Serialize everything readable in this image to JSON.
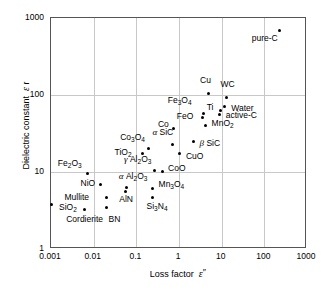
{
  "chart_data": {
    "type": "scatter",
    "title": "",
    "xlabel": "Loss factor ε ″",
    "ylabel": "Dielectric constant ε r",
    "xscale": "log",
    "yscale": "log",
    "xlim": [
      0.001,
      1000
    ],
    "ylim": [
      1,
      1000
    ],
    "xticks": [
      "0.001",
      "0.01",
      "0.1",
      "1",
      "10",
      "100",
      "1000"
    ],
    "yticks": [
      "1",
      "10",
      "100",
      "1000"
    ],
    "grid": true,
    "legend": "none",
    "points": [
      {
        "label": "SiO2",
        "label_html": "SiO<sub>2</sub>",
        "x": 0.001,
        "y": 3.8,
        "lx": 8,
        "ly": 4
      },
      {
        "label": "Cordierite",
        "label_html": "Cordierite",
        "x": 0.006,
        "y": 3.3,
        "lx": -18,
        "ly": 11
      },
      {
        "label": "Mullite",
        "label_html": "Mullite",
        "x": 0.02,
        "y": 4.7,
        "lx": -42,
        "ly": 1
      },
      {
        "label": "BN",
        "label_html": "BN",
        "x": 0.02,
        "y": 3.5,
        "lx": 2,
        "ly": 13
      },
      {
        "label": "Fe2O3",
        "label_html": "Fe<sub>2</sub>O<sub>3</sub>",
        "x": 0.0073,
        "y": 9.5,
        "lx": -30,
        "ly": -10
      },
      {
        "label": "NiO",
        "label_html": "NiO",
        "x": 0.0145,
        "y": 6.8,
        "lx": -20,
        "ly": -1
      },
      {
        "label": "AlN",
        "label_html": "AlN",
        "x": 0.055,
        "y": 5.6,
        "lx": -6,
        "ly": 9
      },
      {
        "label": "alpha-Al2O3",
        "label_html": "<span class='gk'>α</span> Al<sub>2</sub>O<sub>3</sub>",
        "x": 0.06,
        "y": 6.2,
        "lx": -8,
        "ly": -11
      },
      {
        "label": "Si3N4",
        "label_html": "Si<sub>3</sub>N<sub>4</sub>",
        "x": 0.24,
        "y": 4.6,
        "lx": -6,
        "ly": 9
      },
      {
        "label": "Mn3O4",
        "label_html": "Mn<sub>3</sub>O<sub>4</sub>",
        "x": 0.24,
        "y": 6.1,
        "lx": 6,
        "ly": -4
      },
      {
        "label": "TiO2",
        "label_html": "TiO<sub>2</sub>",
        "x": 0.14,
        "y": 17.5,
        "lx": -28,
        "ly": 0
      },
      {
        "label": "Co3O4",
        "label_html": "Co<sub>3</sub>O<sub>4</sub>",
        "x": 0.19,
        "y": 20.0,
        "lx": -28,
        "ly": -11
      },
      {
        "label": "gamma-Al2O3",
        "label_html": "<span class='gk'>γ</span> Al<sub>2</sub>O<sub>3</sub>",
        "x": 0.26,
        "y": 10.5,
        "lx": -30,
        "ly": -10
      },
      {
        "label": "CoO",
        "label_html": "CoO",
        "x": 0.4,
        "y": 10.3,
        "lx": 6,
        "ly": -2
      },
      {
        "label": "alpha-SiC",
        "label_html": "<span class='gk'>α</span> SiC",
        "x": 0.7,
        "y": 22.5,
        "lx": -20,
        "ly": -12
      },
      {
        "label": "Co",
        "label_html": "Co",
        "x": 0.76,
        "y": 37.0,
        "lx": -16,
        "ly": -3
      },
      {
        "label": "CuO",
        "label_html": "CuO",
        "x": 1.05,
        "y": 17.5,
        "lx": 6,
        "ly": 4
      },
      {
        "label": "beta-SiC",
        "label_html": "<span class='gk'>β</span> SiC",
        "x": 2.2,
        "y": 25.0,
        "lx": 6,
        "ly": 3
      },
      {
        "label": "Fe3O4",
        "label_html": "Fe<sub>3</sub>O<sub>4</sub>",
        "x": 3.8,
        "y": 57.0,
        "lx": -36,
        "ly": -13
      },
      {
        "label": "FeO",
        "label_html": "FeO",
        "x": 3.6,
        "y": 51.0,
        "lx": -26,
        "ly": -1
      },
      {
        "label": "MnO2",
        "label_html": "MnO<sub>2</sub>",
        "x": 4.2,
        "y": 40.0,
        "lx": 6,
        "ly": -2
      },
      {
        "label": "Cu",
        "label_html": "Cu",
        "x": 4.8,
        "y": 105.0,
        "lx": -8,
        "ly": -12
      },
      {
        "label": "Ti",
        "label_html": "Ti",
        "x": 9.5,
        "y": 63.0,
        "lx": -14,
        "ly": -2
      },
      {
        "label": "active-C",
        "label_html": "active-C",
        "x": 9.0,
        "y": 55.0,
        "lx": 6,
        "ly": 1
      },
      {
        "label": "Water",
        "label_html": "Water",
        "x": 11.5,
        "y": 70.0,
        "lx": 7,
        "ly": 2
      },
      {
        "label": "WC",
        "label_html": "WC",
        "x": 13.0,
        "y": 93.0,
        "lx": -6,
        "ly": -12
      },
      {
        "label": "pure-C",
        "label_html": "pure-C",
        "x": 230.0,
        "y": 680.0,
        "lx": -28,
        "ly": 8
      }
    ]
  }
}
